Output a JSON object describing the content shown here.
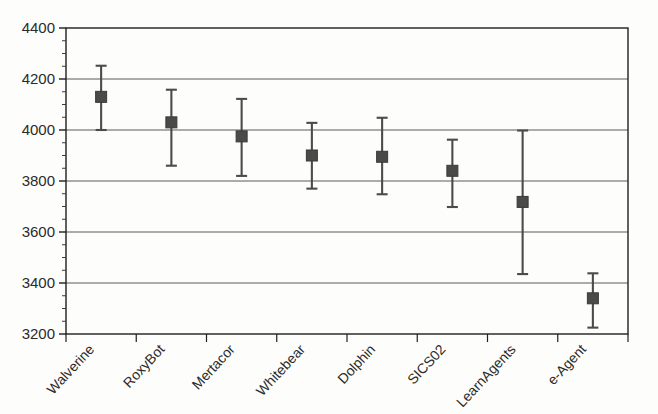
{
  "chart_data": {
    "type": "scatter",
    "title": "",
    "xlabel": "",
    "ylabel": "",
    "grid": true,
    "legend": null,
    "ylim": [
      3200,
      4400
    ],
    "ytick_step": 200,
    "yminor_step": 50,
    "ytick_labels": [
      "4400",
      "4200",
      "4000",
      "3800",
      "3600",
      "3400",
      "3200"
    ],
    "ytick_values": [
      4400,
      4200,
      4000,
      3800,
      3600,
      3400,
      3200
    ],
    "categories": [
      "Walverine",
      "RoxyBot",
      "Mertacor",
      "Whitebear",
      "Dolphin",
      "SICS02",
      "LearnAgents",
      "e-Agent"
    ],
    "values": [
      4130,
      4030,
      3975,
      3900,
      3895,
      3840,
      3718,
      3340
    ],
    "error_low": [
      4000,
      3860,
      3820,
      3770,
      3748,
      3698,
      3435,
      3225
    ],
    "error_high": [
      4252,
      4158,
      4122,
      4028,
      4048,
      3962,
      3998,
      3438
    ],
    "series": [
      {
        "name": "mean score with error bars",
        "points": [
          {
            "category": "Walverine",
            "value": 4130,
            "low": 4000,
            "high": 4252
          },
          {
            "category": "RoxyBot",
            "value": 4030,
            "low": 3860,
            "high": 4158
          },
          {
            "category": "Mertacor",
            "value": 3975,
            "low": 3820,
            "high": 4122
          },
          {
            "category": "Whitebear",
            "value": 3900,
            "low": 3770,
            "high": 4028
          },
          {
            "category": "Dolphin",
            "value": 3895,
            "low": 3748,
            "high": 4048
          },
          {
            "category": "SICS02",
            "value": 3840,
            "low": 3698,
            "high": 3962
          },
          {
            "category": "LearnAgents",
            "value": 3718,
            "low": 3435,
            "high": 3998
          },
          {
            "category": "e-Agent",
            "value": 3340,
            "low": 3225,
            "high": 3438
          }
        ]
      }
    ],
    "marker": {
      "shape": "square",
      "color": "#4a4a4a",
      "size_px": 11
    },
    "errorbar": {
      "color": "#4b4b4b",
      "cap_width_px": 11
    }
  },
  "style": {
    "background": "#fdfdfc",
    "frame_color": "#1e1e1e",
    "grid_color": "#5a5a5a",
    "text_color": "#2b2b2b",
    "xlabel_rotation_deg": -47
  }
}
